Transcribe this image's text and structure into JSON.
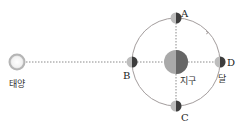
{
  "diagram": {
    "sun": {
      "label": "태양"
    },
    "earth": {
      "label": "지구"
    },
    "moon": {
      "label": "달"
    },
    "positions": [
      {
        "id": "A",
        "label": "A"
      },
      {
        "id": "B",
        "label": "B"
      },
      {
        "id": "C",
        "label": "C"
      },
      {
        "id": "D",
        "label": "D"
      }
    ],
    "colors": {
      "orbit": "#a09a9a",
      "dashed": "#888888",
      "sun_ring": "#bdbdbd",
      "light_side": "#c9c9c9",
      "dark_side": "#4a4a4a"
    }
  }
}
